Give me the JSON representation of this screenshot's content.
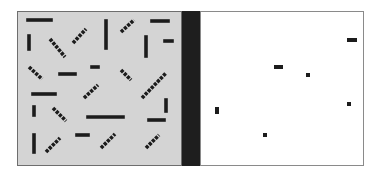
{
  "colors": {
    "background": "#ffffff",
    "left_panel_fill": "#d4d4d4",
    "left_panel_border": "#6e6e6e",
    "separator_bar": "#1e1e1e",
    "right_panel_fill": "#ffffff",
    "right_panel_border": "#8a8a8a",
    "mark": "#1c1c1c"
  },
  "left_panel": {
    "x": 17,
    "y": 11,
    "width": 164,
    "height": 154,
    "segments": [
      {
        "x1": 28,
        "y1": 20,
        "x2": 51,
        "y2": 20,
        "style": "solid"
      },
      {
        "x1": 29,
        "y1": 36,
        "x2": 29,
        "y2": 49,
        "style": "solid"
      },
      {
        "x1": 50,
        "y1": 39,
        "x2": 65,
        "y2": 57,
        "style": "dash"
      },
      {
        "x1": 73,
        "y1": 43,
        "x2": 86,
        "y2": 29,
        "style": "dash"
      },
      {
        "x1": 106,
        "y1": 21,
        "x2": 106,
        "y2": 48,
        "style": "solid"
      },
      {
        "x1": 121,
        "y1": 32,
        "x2": 134,
        "y2": 20,
        "style": "dash"
      },
      {
        "x1": 152,
        "y1": 21,
        "x2": 168,
        "y2": 21,
        "style": "solid"
      },
      {
        "x1": 146,
        "y1": 37,
        "x2": 146,
        "y2": 56,
        "style": "solid"
      },
      {
        "x1": 165,
        "y1": 41,
        "x2": 172,
        "y2": 41,
        "style": "solid"
      },
      {
        "x1": 29,
        "y1": 67,
        "x2": 42,
        "y2": 79,
        "style": "dash"
      },
      {
        "x1": 60,
        "y1": 74,
        "x2": 75,
        "y2": 74,
        "style": "solid"
      },
      {
        "x1": 92,
        "y1": 67,
        "x2": 98,
        "y2": 67,
        "style": "solid"
      },
      {
        "x1": 121,
        "y1": 70,
        "x2": 131,
        "y2": 80,
        "style": "dash"
      },
      {
        "x1": 33,
        "y1": 94,
        "x2": 55,
        "y2": 94,
        "style": "solid"
      },
      {
        "x1": 84,
        "y1": 98,
        "x2": 98,
        "y2": 85,
        "style": "dash"
      },
      {
        "x1": 142,
        "y1": 98,
        "x2": 166,
        "y2": 73,
        "style": "dash"
      },
      {
        "x1": 34,
        "y1": 107,
        "x2": 34,
        "y2": 115,
        "style": "solid"
      },
      {
        "x1": 53,
        "y1": 108,
        "x2": 66,
        "y2": 121,
        "style": "dash"
      },
      {
        "x1": 88,
        "y1": 117,
        "x2": 123,
        "y2": 117,
        "style": "solid"
      },
      {
        "x1": 166,
        "y1": 100,
        "x2": 166,
        "y2": 111,
        "style": "solid"
      },
      {
        "x1": 149,
        "y1": 120,
        "x2": 164,
        "y2": 120,
        "style": "solid"
      },
      {
        "x1": 34,
        "y1": 135,
        "x2": 34,
        "y2": 152,
        "style": "solid"
      },
      {
        "x1": 46,
        "y1": 152,
        "x2": 60,
        "y2": 138,
        "style": "dash"
      },
      {
        "x1": 77,
        "y1": 135,
        "x2": 88,
        "y2": 135,
        "style": "solid"
      },
      {
        "x1": 101,
        "y1": 148,
        "x2": 115,
        "y2": 134,
        "style": "dash"
      },
      {
        "x1": 146,
        "y1": 148,
        "x2": 159,
        "y2": 135,
        "style": "dash"
      }
    ]
  },
  "separator": {
    "x": 182,
    "y": 11,
    "width": 18,
    "height": 154
  },
  "right_panel": {
    "x": 200,
    "y": 11,
    "width": 163,
    "height": 154,
    "marks": [
      {
        "x": 347,
        "y": 38,
        "w": 10,
        "h": 4
      },
      {
        "x": 274,
        "y": 65,
        "w": 9,
        "h": 4
      },
      {
        "x": 306,
        "y": 73,
        "w": 4,
        "h": 4
      },
      {
        "x": 215,
        "y": 107,
        "w": 4,
        "h": 7
      },
      {
        "x": 347,
        "y": 102,
        "w": 4,
        "h": 4
      },
      {
        "x": 263,
        "y": 133,
        "w": 4,
        "h": 4
      }
    ]
  }
}
